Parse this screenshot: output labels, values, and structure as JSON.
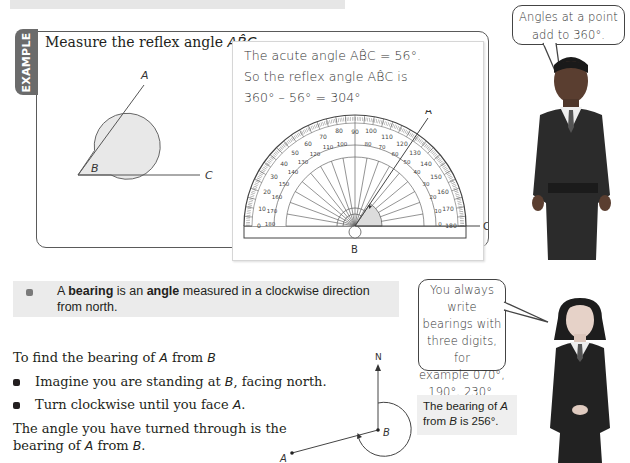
{
  "example": {
    "tab_label": "EXAMPLE",
    "question": {
      "prefix": "Measure the reflex angle ",
      "angle_name": "AB̂C",
      "suffix": "."
    },
    "diagram": {
      "point_a": "A",
      "point_b": "B",
      "point_c": "C"
    },
    "solution": {
      "line1": "The acute angle AB̂C = 56°.",
      "line2": "So the reflex angle AB̂C is",
      "line3": "360° – 56° = 304°"
    },
    "protractor": {
      "label_a": "A",
      "label_b": "B",
      "label_c": "C",
      "outer_scale": [
        "0",
        "10",
        "20",
        "30",
        "40",
        "50",
        "60",
        "70",
        "80",
        "90",
        "100",
        "110",
        "120",
        "130",
        "140",
        "150",
        "160",
        "170",
        "180"
      ],
      "inner_scale": [
        "180",
        "170",
        "160",
        "150",
        "140",
        "130",
        "120",
        "110",
        "100",
        "90",
        "80",
        "70",
        "60",
        "50",
        "40",
        "30",
        "20",
        "10",
        "0"
      ]
    }
  },
  "bubbles": {
    "top": "Angles at a point add to 360°.",
    "top_line1": "Angles at a point",
    "top_line2": "add to 360°.",
    "bottom_line1": "You always write",
    "bottom_line2": "bearings with",
    "bottom_line3": "three digits, for",
    "bottom_line4": "example 070°,",
    "bottom_line5": "190°, 230°."
  },
  "definition": {
    "part1": "A ",
    "bold1": "bearing",
    "part2": " is an ",
    "bold2": "angle",
    "part3": " measured in a clockwise direction",
    "line2": "from north."
  },
  "instructions": {
    "heading_prefix": "To find the bearing of ",
    "heading_a": "A",
    "heading_mid": " from ",
    "heading_b": "B",
    "step1_prefix": "Imagine you are standing at ",
    "step1_b": "B",
    "step1_suffix": ", facing north.",
    "step2_prefix": "Turn clockwise until you face ",
    "step2_a": "A",
    "step2_suffix": ".",
    "conclusion_line1": "The angle you have turned through is the",
    "conclusion_prefix": "bearing of ",
    "conclusion_a": "A",
    "conclusion_mid": " from ",
    "conclusion_b": "B",
    "conclusion_suffix": "."
  },
  "bearing_diagram": {
    "north": "N",
    "point_a": "A",
    "point_b": "B"
  },
  "answer": {
    "line1_prefix": "The bearing of ",
    "line1_a": "A",
    "line2_prefix": "from ",
    "line2_b": "B",
    "line2_suffix": " is 256°."
  },
  "characters": {
    "boy": "cartoon-student-boy",
    "girl": "cartoon-student-girl"
  }
}
